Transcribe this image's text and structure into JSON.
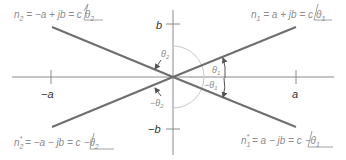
{
  "diagram": {
    "type": "complex-plane",
    "colors": {
      "phasor_line": "#6e6e6e",
      "axis": "#8a8a8a",
      "arc": "#c8c8c8",
      "label_text": "#8c8c8c",
      "axis_label_text": "#333333"
    },
    "axes": {
      "x_pos_tick": "a",
      "x_neg_tick": "−a",
      "y_pos_tick": "b",
      "y_neg_tick": "−b"
    },
    "phasors": [
      {
        "id": "n1",
        "lhs": "n",
        "sub": "1",
        "sup": "",
        "eq": " = a + jb = c",
        "angle": "θ",
        "angle_sub": "1",
        "angle_sign": ""
      },
      {
        "id": "n2",
        "lhs": "n",
        "sub": "2",
        "sup": "",
        "eq": " = −a + jb = c",
        "angle": "θ",
        "angle_sub": "2",
        "angle_sign": ""
      },
      {
        "id": "n1_conj",
        "lhs": "n",
        "sub": "1",
        "sup": "*",
        "eq": " = a − jb = c",
        "angle": "θ",
        "angle_sub": "1",
        "angle_sign": "−"
      },
      {
        "id": "n2_conj",
        "lhs": "n",
        "sub": "2",
        "sup": "*",
        "eq": " = −a − jb = c",
        "angle": "θ",
        "angle_sub": "2",
        "angle_sign": "−"
      }
    ],
    "angle_labels": {
      "theta1": "θ",
      "theta1_sub": "1",
      "neg_theta1": "−θ",
      "neg_theta1_sub": "1",
      "theta2": "θ",
      "theta2_sub": "2",
      "neg_theta2": "−θ",
      "neg_theta2_sub": "2"
    }
  }
}
